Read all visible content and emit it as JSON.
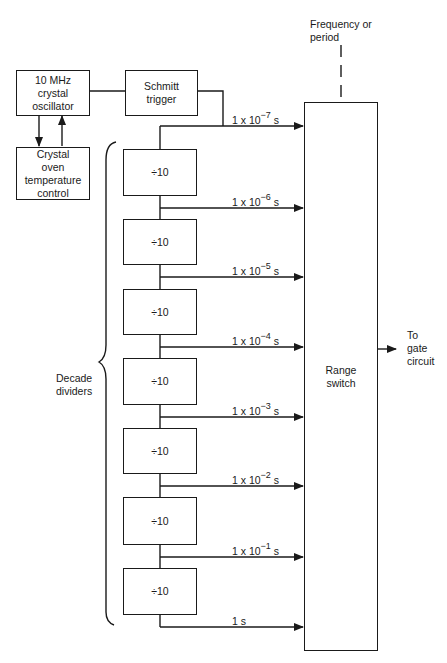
{
  "oscillator": {
    "label_line1": "10 MHz",
    "label_line2": "crystal",
    "label_line3": "oscillator"
  },
  "oven": {
    "label_line1": "Crystal",
    "label_line2": "oven",
    "label_line3": "temperature",
    "label_line4": "control"
  },
  "schmitt": {
    "label_line1": "Schmitt",
    "label_line2": "trigger"
  },
  "frequency_input": {
    "label_line1": "Frequency or",
    "label_line2": "period"
  },
  "range_switch": {
    "label_line1": "Range",
    "label_line2": "switch"
  },
  "output": {
    "label_line1": "To",
    "label_line2": "gate",
    "label_line3": "circuit"
  },
  "decade_group": {
    "label_line1": "Decade",
    "label_line2": "dividers"
  },
  "dividers": [
    {
      "label": "÷10"
    },
    {
      "label": "÷10"
    },
    {
      "label": "÷10"
    },
    {
      "label": "÷10"
    },
    {
      "label": "÷10"
    },
    {
      "label": "÷10"
    },
    {
      "label": "÷10"
    }
  ],
  "taps": [
    {
      "base": "1 x 10",
      "exp": "−7",
      "unit": " s"
    },
    {
      "base": "1 x 10",
      "exp": "−6",
      "unit": " s"
    },
    {
      "base": "1 x 10",
      "exp": "−5",
      "unit": " s"
    },
    {
      "base": "1 x 10",
      "exp": "−4",
      "unit": " s"
    },
    {
      "base": "1 x 10",
      "exp": "−3",
      "unit": " s"
    },
    {
      "base": "1 x 10",
      "exp": "−2",
      "unit": " s"
    },
    {
      "base": "1 x 10",
      "exp": "−1",
      "unit": " s"
    },
    {
      "base": "1 s",
      "exp": "",
      "unit": ""
    }
  ]
}
